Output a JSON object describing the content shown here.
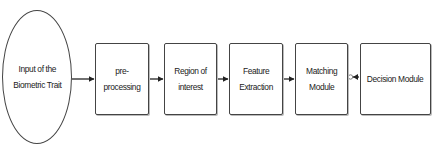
{
  "diagram": {
    "type": "flowchart",
    "direction": "left-to-right",
    "nodes": [
      {
        "id": "input",
        "shape": "ellipse",
        "label": "Input of the\nBiometric Trait"
      },
      {
        "id": "preprocessing",
        "shape": "rectangle",
        "label": "pre-processing"
      },
      {
        "id": "roi",
        "shape": "rectangle",
        "label": "Region of\ninterest"
      },
      {
        "id": "feature",
        "shape": "rectangle",
        "label": "Feature\nExtraction"
      },
      {
        "id": "matching",
        "shape": "rectangle",
        "label": "Matching\nModule"
      },
      {
        "id": "decision",
        "shape": "rectangle",
        "label": "Decision Module"
      }
    ],
    "edges": [
      {
        "from": "input",
        "to": "preprocessing",
        "style": "arrow"
      },
      {
        "from": "preprocessing",
        "to": "roi",
        "style": "arrow"
      },
      {
        "from": "roi",
        "to": "feature",
        "style": "arrow"
      },
      {
        "from": "feature",
        "to": "matching",
        "style": "arrow"
      },
      {
        "from": "decision",
        "to": "matching",
        "style": "arrow-with-open-circle-tail"
      }
    ],
    "colors": {
      "stroke": "#444444",
      "text": "#222222",
      "background": "#ffffff"
    }
  }
}
